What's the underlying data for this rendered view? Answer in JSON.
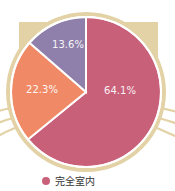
{
  "chart_data": {
    "type": "pie",
    "title": "",
    "categories": [
      "完全室内",
      "",
      ""
    ],
    "values": [
      64.1,
      22.3,
      13.6
    ],
    "labels": [
      "64.1%",
      "22.3%",
      "13.6%"
    ],
    "colors": [
      "#c9607a",
      "#f08a66",
      "#8f80ab"
    ],
    "start_angle": "12 o'clock, clockwise",
    "legend": {
      "position": "bottom",
      "entries": [
        "完全室内"
      ]
    },
    "decoration": "cat-head silhouette (tan) behind pie with ears and whiskers"
  },
  "colors": {
    "cat": "#e3d2a6",
    "separator": "#ffffff"
  },
  "legend": {
    "items": [
      {
        "label": "完全室内",
        "color": "#c9607a"
      }
    ]
  }
}
